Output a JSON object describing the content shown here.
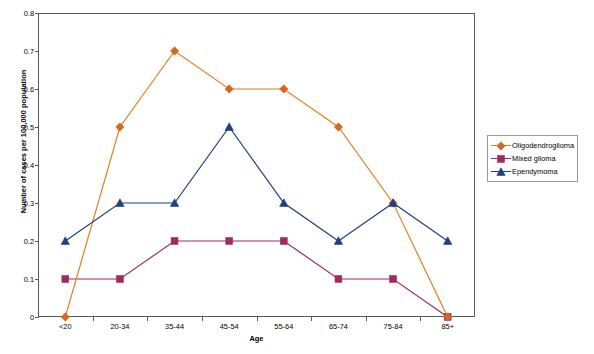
{
  "chart_data": {
    "type": "line",
    "title": "",
    "xlabel": "Age",
    "ylabel": "Number of cases per 100,000 population",
    "categories": [
      "<20",
      "20-34",
      "35-44",
      "45-54",
      "55-64",
      "65-74",
      "75-84",
      "85+"
    ],
    "ylim": [
      0,
      0.8
    ],
    "yticks": [
      "0",
      "0.1",
      "0.2",
      "0.3",
      "0.4",
      "0.5",
      "0.6",
      "0.7",
      "0.8"
    ],
    "ytick_values": [
      0,
      0.1,
      0.2,
      0.3,
      0.4,
      0.5,
      0.6,
      0.7,
      0.8
    ],
    "grid": false,
    "legend_position": "right",
    "series": [
      {
        "name": "Oligodendroglioma",
        "color": "#E0811F",
        "marker": "diamond",
        "marker_color": "#D2691E",
        "values": [
          0,
          0.5,
          0.7,
          0.6,
          0.6,
          0.5,
          0.3,
          0
        ]
      },
      {
        "name": "Mixed glioma",
        "color": "#9E2B5E",
        "marker": "square",
        "marker_color": "#9E2B5E",
        "values": [
          0.1,
          0.1,
          0.2,
          0.2,
          0.2,
          0.1,
          0.1,
          0
        ]
      },
      {
        "name": "Ependymoma",
        "color": "#1F3F7F",
        "marker": "triangle",
        "marker_color": "#1F3F7F",
        "values": [
          0.2,
          0.3,
          0.3,
          0.5,
          0.3,
          0.2,
          0.3,
          0.2
        ]
      }
    ]
  },
  "axes": {
    "frame_color": "#58585a"
  }
}
